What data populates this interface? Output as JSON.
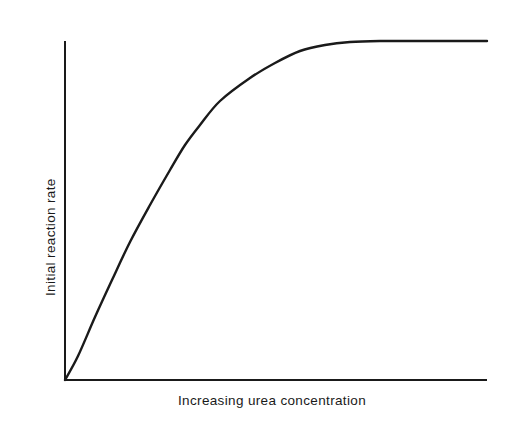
{
  "figure": {
    "background_color": "#ffffff",
    "ink_color": "#1a1a1a",
    "width": 514,
    "height": 427
  },
  "axes": {
    "y_label": "Initial reaction rate",
    "x_label": "Increasing urea concentration",
    "origin": {
      "x": 65,
      "y": 380
    },
    "y_axis_top": {
      "x": 65,
      "y": 42
    },
    "x_axis_right": {
      "x": 486,
      "y": 380
    },
    "line_color": "#1a1a1a",
    "line_width": 2,
    "ticks": "none",
    "grid": "off"
  },
  "chart_data": {
    "type": "line",
    "title": "",
    "subtitle": "",
    "xlabel": "Increasing urea concentration",
    "ylabel": "Initial reaction rate",
    "legend": [],
    "legend_position": "none",
    "grid": false,
    "axis_ticks_labeled": false,
    "xlim": [
      0,
      100
    ],
    "ylim": [
      0,
      100
    ],
    "series": [
      {
        "name": "Initial reaction rate vs urea concentration",
        "color": "#1a1a1a",
        "x": [
          0,
          2,
          5,
          8,
          12,
          16,
          20,
          25,
          30,
          35,
          40,
          45,
          50,
          55,
          60,
          65,
          70,
          75,
          80,
          85,
          90,
          95,
          100
        ],
        "y": [
          0,
          5,
          13,
          21,
          31,
          41,
          50,
          60,
          68,
          75,
          81,
          86,
          89,
          92,
          94,
          96,
          97,
          98,
          99,
          100,
          100,
          100,
          100
        ]
      }
    ],
    "pixel_path": [
      {
        "x": 65,
        "y": 380
      },
      {
        "x": 78,
        "y": 356
      },
      {
        "x": 95,
        "y": 317
      },
      {
        "x": 112,
        "y": 280
      },
      {
        "x": 130,
        "y": 242
      },
      {
        "x": 150,
        "y": 205
      },
      {
        "x": 170,
        "y": 170
      },
      {
        "x": 185,
        "y": 145
      },
      {
        "x": 200,
        "y": 125
      },
      {
        "x": 220,
        "y": 101
      },
      {
        "x": 250,
        "y": 78
      },
      {
        "x": 275,
        "y": 63
      },
      {
        "x": 300,
        "y": 51
      },
      {
        "x": 325,
        "y": 45
      },
      {
        "x": 350,
        "y": 42
      },
      {
        "x": 380,
        "y": 41
      },
      {
        "x": 420,
        "y": 41
      },
      {
        "x": 487,
        "y": 41
      }
    ]
  }
}
